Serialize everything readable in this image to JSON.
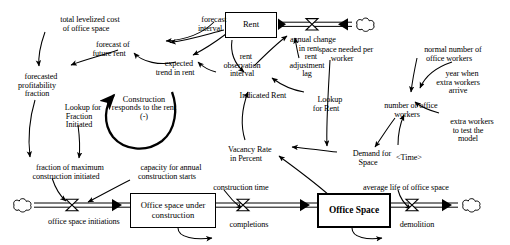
{
  "diagram": {
    "type": "system-dynamics-stock-and-flow",
    "stocks": [
      {
        "id": "rent",
        "label": "Rent",
        "style": "thin"
      },
      {
        "id": "office_space_under_construction",
        "label": "Office space under\nconstruction",
        "style": "thin"
      },
      {
        "id": "office_space",
        "label": "Office Space",
        "style": "thick"
      }
    ],
    "flows": [
      {
        "id": "annual_change_in_rent",
        "label": "annual change\nin rent"
      },
      {
        "id": "office_space_initiations",
        "label": "office space initiations"
      },
      {
        "id": "completions",
        "label": "completions"
      },
      {
        "id": "demolition",
        "label": "demolition"
      }
    ],
    "variables": [
      {
        "id": "total_levelized_cost",
        "label": "total levelized cost\nof office space"
      },
      {
        "id": "forecast_interval",
        "label": "forecast\ninterval"
      },
      {
        "id": "forecast_of_future_rent",
        "label": "forecast of\nfuture rent"
      },
      {
        "id": "forecasted_profitability_fraction",
        "label": "forecasted\nprofitability\nfraction"
      },
      {
        "id": "expected_trend_in_rent",
        "label": "expected\ntrend in rent"
      },
      {
        "id": "rent_observation_interval",
        "label": "rent\nobservation\ninterval"
      },
      {
        "id": "rent_adjustment_lag",
        "label": "rent\nadjustment\nlag"
      },
      {
        "id": "space_needed_per_worker",
        "label": "space needed per\nworker"
      },
      {
        "id": "normal_number_of_office_workers",
        "label": "normal number of\noffice workers"
      },
      {
        "id": "lookup_for_fraction_initiated",
        "label": "Lookup for\nFraction\nInitiated"
      },
      {
        "id": "indicated_rent",
        "label": "Indicated Rent"
      },
      {
        "id": "lookup_for_rent",
        "label": "Lookup\nfor Rent"
      },
      {
        "id": "number_of_office_workers",
        "label": "number of office\nworkers"
      },
      {
        "id": "year_when_extra_workers_arrive",
        "label": "year when\nextra workers\narrive"
      },
      {
        "id": "extra_workers_to_test_the_model",
        "label": "extra workers\nto test the\nmodel"
      },
      {
        "id": "vacancy_rate_in_percent",
        "label": "Vacancy Rate\nin Percent"
      },
      {
        "id": "demand_for_space",
        "label": "Demand for\nSpace"
      },
      {
        "id": "time",
        "label": "<Time>"
      },
      {
        "id": "fraction_of_maximum_construction_initiated",
        "label": "fraction of maximum\nconstruction initiated"
      },
      {
        "id": "capacity_for_annual_construction_starts",
        "label": "capacity for annual\nconstruction starts"
      },
      {
        "id": "construction_time",
        "label": "construction time"
      },
      {
        "id": "average_life_of_office_space",
        "label": "average life of office space"
      }
    ],
    "loops": [
      {
        "id": "construction_responds_to_the_rent",
        "label": "Construction\nresponds to\nthe rent",
        "polarity": "(-)"
      }
    ],
    "colors": {
      "line": "#000000",
      "background": "#ffffff",
      "caption": "#7a7a7a"
    }
  }
}
